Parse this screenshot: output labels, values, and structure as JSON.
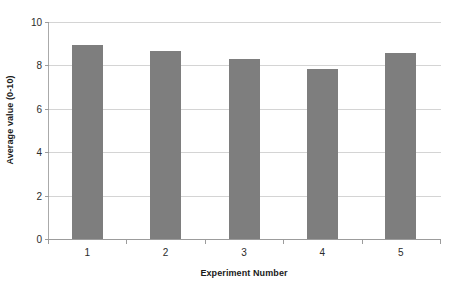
{
  "chart_data": {
    "type": "bar",
    "title": "",
    "subtitle": "",
    "xlabel": "Experiment Number",
    "ylabel": "Average value (0-10)",
    "categories": [
      "1",
      "2",
      "3",
      "4",
      "5"
    ],
    "values": [
      8.95,
      8.65,
      8.3,
      7.85,
      8.55
    ],
    "series": [
      {
        "name": "Average value",
        "values": [
          8.95,
          8.65,
          8.3,
          7.85,
          8.55
        ]
      }
    ],
    "ylim": [
      0,
      10
    ],
    "y_ticks": [
      0,
      2,
      4,
      6,
      8,
      10
    ],
    "y_tick_labels": [
      "0",
      "2",
      "4",
      "6",
      "8",
      "10"
    ],
    "x_tick_labels": [
      "1",
      "2",
      "3",
      "4",
      "5"
    ],
    "grid": "horizontal",
    "legend": "none",
    "annotations": [],
    "colors": {
      "bar": "#7e7e7e",
      "gridline": "#d4d4d4",
      "axis": "#9c9c9c",
      "text": "#2b2b2b",
      "title_text": "#1a1a1a",
      "background": "#ffffff"
    }
  }
}
